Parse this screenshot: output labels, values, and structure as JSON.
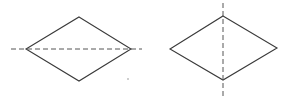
{
  "figures": [
    {
      "name": "left-rhombus",
      "vertices": {
        "top": [
          79,
          17
        ],
        "right": [
          131,
          49
        ],
        "bottom": [
          79,
          81
        ],
        "left": [
          26,
          49
        ]
      },
      "axis": {
        "orientation": "horizontal",
        "from": [
          11,
          49
        ],
        "to": [
          142,
          49
        ]
      }
    },
    {
      "name": "right-rhombus",
      "vertices": {
        "top": [
          223,
          16
        ],
        "right": [
          277,
          48
        ],
        "bottom": [
          223,
          80
        ],
        "left": [
          170,
          49
        ]
      },
      "axis": {
        "orientation": "vertical",
        "from": [
          223,
          3
        ],
        "to": [
          223,
          96
        ]
      }
    }
  ],
  "marks": [
    {
      "name": "stray-dot",
      "at": [
        128,
        79
      ]
    }
  ],
  "colors": {
    "stroke": "#3a3a3a",
    "axis": "#555555",
    "background": "#ffffff"
  }
}
